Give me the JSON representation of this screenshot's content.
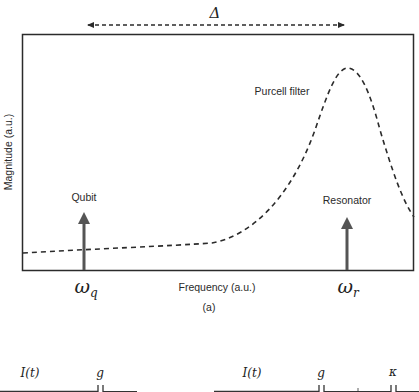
{
  "figure": {
    "panel_label": "(a)",
    "delta_label": "Δ",
    "x_axis_label": "Frequency (a.u.)",
    "y_axis_label": "Magnitude (a.u.)",
    "curve_label": "Purcell filter",
    "markers": [
      {
        "label": "Qubit",
        "tick_symbol": "ω",
        "tick_sub": "q"
      },
      {
        "label": "Resonator",
        "tick_symbol": "ω",
        "tick_sub": "r"
      }
    ],
    "colors": {
      "frame": "#2b2b2b",
      "curve": "#2b2b2b",
      "arrow": "#555555",
      "background": "#ffffff"
    }
  },
  "circuit": {
    "left": {
      "current_label": "I(t)",
      "coupling_label": "g"
    },
    "right": {
      "current_label": "I(t)",
      "coupling_label": "g",
      "decay_label": "κ"
    }
  }
}
